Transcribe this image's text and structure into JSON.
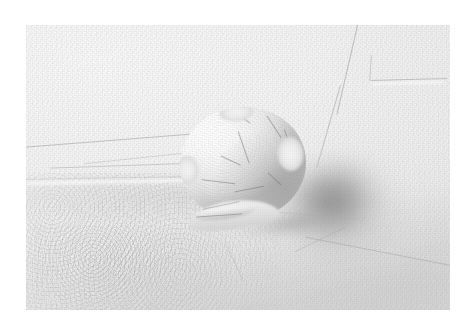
{
  "image": {
    "kind": "photograph",
    "subject": "white clay sphere resting against a textured white plaster wall",
    "orientation": "landscape",
    "palette": {
      "paper_border": "#ffffff",
      "wall_light": "#fdfdfd",
      "wall_mid": "#f0f0f0",
      "wall_shadow": "#dcdcdc",
      "cast_shadow_darkest": "#9a9a9a",
      "ball_highlight": "#ffffff",
      "ball_midtone": "#ececec",
      "ball_terminator": "#c2c2c2",
      "incised_line": "#8e8e8e"
    },
    "frame": {
      "canvas_width": 476,
      "canvas_height": 331,
      "plate_left": 26,
      "plate_top": 25,
      "plate_width": 424,
      "plate_height": 285
    },
    "lighting": {
      "direction": "upper-left",
      "shadow_direction": "lower-right",
      "quality": "soft diffuse"
    },
    "subject_geometry": {
      "center_x": 243,
      "center_y": 163,
      "radius": 58,
      "description": "hand-rolled ball, slightly flattened where it meets the surface"
    },
    "surface_marks": [
      {
        "name": "upper-right-seam",
        "note": "long faint diagonal joint running down-left from the top edge"
      },
      {
        "name": "upper-right-ledge",
        "note": "short horizontal step in the plaster"
      },
      {
        "name": "left-radiating-line-1",
        "note": "thin scored line sweeping left from the ball"
      },
      {
        "name": "left-radiating-line-2",
        "note": "second thin scored line below the first"
      },
      {
        "name": "mid-trowel-sweep",
        "note": "broad soft trowel arc across the middle"
      },
      {
        "name": "lower-left-stipple",
        "note": "coarse granular stippled patch"
      },
      {
        "name": "lower-right-crack",
        "note": "faint hairline crack crossing the lower right"
      }
    ],
    "ball_marks": [
      {
        "name": "crown-crack",
        "note": "short crack near the top of the sphere"
      },
      {
        "name": "right-crack",
        "note": "curved crack down the shaded right flank"
      },
      {
        "name": "centre-crack",
        "note": "vertical fissure through the middle"
      },
      {
        "name": "foot-fold",
        "note": "pressed overlapping fold at the base"
      }
    ]
  }
}
